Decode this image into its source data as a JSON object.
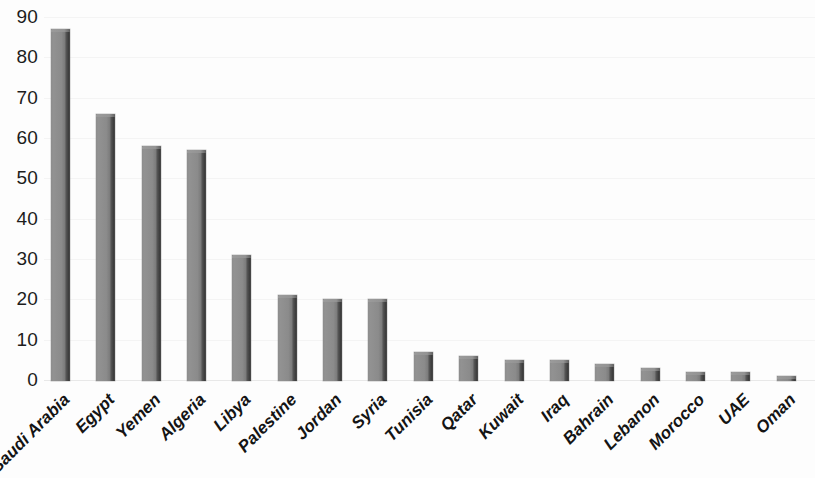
{
  "chart_data": {
    "type": "bar",
    "title": "",
    "subtitle": "",
    "xlabel": "",
    "ylabel": "",
    "categories": [
      "Saudi Arabia",
      "Egypt",
      "Yemen",
      "Algeria",
      "Libya",
      "Palestine",
      "Jordan",
      "Syria",
      "Tunisia",
      "Qatar",
      "Kuwait",
      "Iraq",
      "Bahrain",
      "Lebanon",
      "Morocco",
      "UAE",
      "Oman"
    ],
    "values": [
      87,
      66,
      58,
      57,
      31,
      21,
      20,
      20,
      7,
      6,
      5,
      5,
      4,
      3,
      2,
      2,
      1
    ],
    "ylim": [
      0,
      90
    ],
    "ytick_step": 10,
    "yticks": [
      "90",
      "80",
      "70",
      "60",
      "50",
      "40",
      "30",
      "20",
      "10",
      "0"
    ],
    "ytick_values": [
      90,
      80,
      70,
      60,
      50,
      40,
      30,
      20,
      10,
      0
    ],
    "grid": true,
    "legend": false,
    "legend_position": "none",
    "bar_color": "#8b8b8b",
    "bar_edge_color": "#4a4a4a",
    "background_color": "#fdfdfd",
    "gridline_color": "#f4f4f4",
    "axis_text_color": "#1c1c1c",
    "xtick_label_rotation": "-45"
  }
}
